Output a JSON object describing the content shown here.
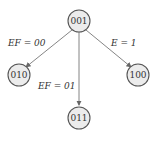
{
  "diagram": {
    "type": "tree",
    "nodes": [
      {
        "id": "n001",
        "label": "001",
        "x": 79,
        "y": 21
      },
      {
        "id": "n010",
        "label": "010",
        "x": 19,
        "y": 75
      },
      {
        "id": "n011",
        "label": "011",
        "x": 79,
        "y": 118
      },
      {
        "id": "n100",
        "label": "100",
        "x": 138,
        "y": 75
      }
    ],
    "edges": [
      {
        "from": "001",
        "to": "010",
        "label": "EF = 00"
      },
      {
        "from": "001",
        "to": "011",
        "label": "EF = 01"
      },
      {
        "from": "001",
        "to": "100",
        "label": "E = 1"
      }
    ]
  }
}
